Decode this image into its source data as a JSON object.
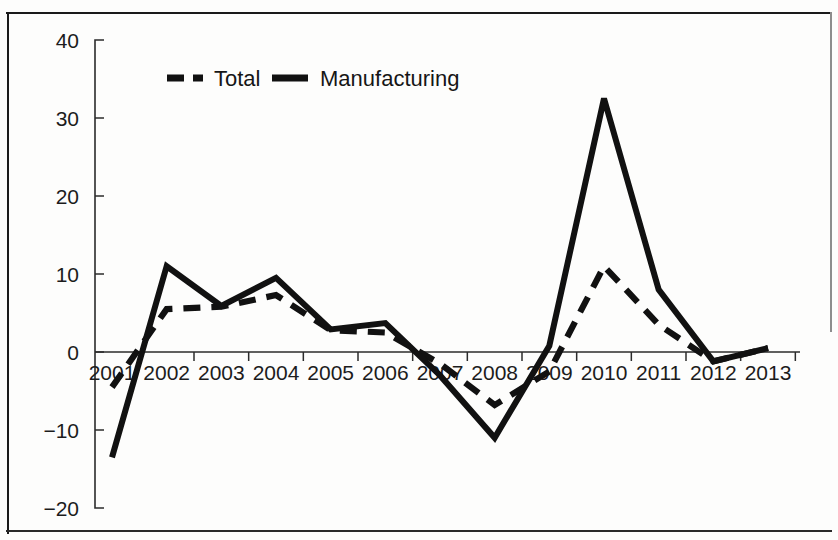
{
  "chart_data": {
    "type": "line",
    "title": "",
    "xlabel": "",
    "ylabel": "",
    "categories": [
      "2001",
      "2002",
      "2003",
      "2004",
      "2005",
      "2006",
      "2007",
      "2008",
      "2009",
      "2010",
      "2011",
      "2012",
      "2013"
    ],
    "series": [
      {
        "name": "Total",
        "style": "dashed",
        "values": [
          -4.5,
          5.5,
          5.8,
          7.3,
          2.8,
          2.5,
          -1.5,
          -6.8,
          -2.5,
          11.0,
          3.5,
          -1.2,
          0.5
        ]
      },
      {
        "name": "Manufacturing",
        "style": "solid",
        "values": [
          -13.5,
          11.0,
          5.9,
          9.5,
          2.9,
          3.7,
          -3.0,
          -11.0,
          0.8,
          32.5,
          8.0,
          -1.2,
          0.5
        ]
      }
    ],
    "ylim": [
      -20,
      40
    ],
    "ytick_labels": [
      "40",
      "30",
      "20",
      "10",
      "0",
      "-10",
      "-20"
    ],
    "ytick_values": [
      40,
      30,
      20,
      10,
      0,
      -10,
      -20
    ],
    "grid": false,
    "legend_position": "top-center",
    "axis_color": "#2b2b2b",
    "series_color": "#111111"
  },
  "legend": {
    "entries": [
      {
        "label": "Total"
      },
      {
        "label": "Manufacturing"
      }
    ]
  }
}
